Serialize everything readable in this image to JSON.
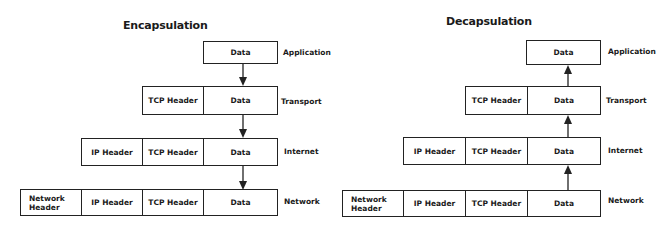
{
  "encapsulation": {
    "title": "Encapsulation",
    "direction": "down",
    "rows": [
      {
        "layer": "Application",
        "cells": [
          "Data"
        ]
      },
      {
        "layer": "Transport",
        "cells": [
          "TCP Header",
          "Data"
        ]
      },
      {
        "layer": "Internet",
        "cells": [
          "IP Header",
          "TCP Header",
          "Data"
        ]
      },
      {
        "layer": "Network",
        "cells": [
          "Network Header",
          "IP Header",
          "TCP Header",
          "Data"
        ]
      }
    ]
  },
  "decapsulation": {
    "title": "Decapsulation",
    "direction": "up",
    "rows": [
      {
        "layer": "Application",
        "cells": [
          "Data"
        ]
      },
      {
        "layer": "Transport",
        "cells": [
          "TCP Header",
          "Data"
        ]
      },
      {
        "layer": "Internet",
        "cells": [
          "IP Header",
          "TCP Header",
          "Data"
        ]
      },
      {
        "layer": "Network",
        "cells": [
          "Network Header",
          "IP Header",
          "TCP Header",
          "Data"
        ]
      }
    ]
  },
  "icons": {
    "down_arrow": "arrow-down-icon",
    "up_arrow": "arrow-up-icon"
  },
  "colors": {
    "stroke": "#222222",
    "background": "#ffffff",
    "text": "#1a1a1a"
  }
}
